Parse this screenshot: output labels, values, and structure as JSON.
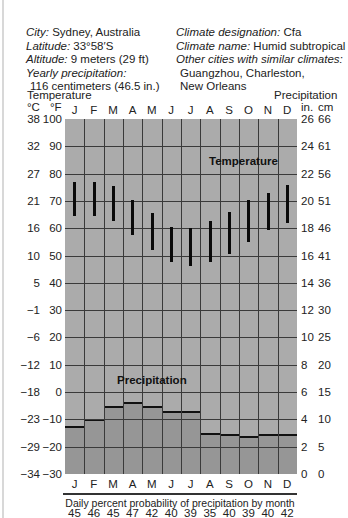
{
  "info": {
    "city_label": "City:",
    "city": "Sydney, Australia",
    "latitude_label": "Latitude:",
    "latitude": "33°58′S",
    "altitude_label": "Altitude:",
    "altitude": "9 meters (29 ft)",
    "yearly_precip_label": "Yearly precipitation:",
    "yearly_precip": "116 centimeters (46.5 in.)",
    "climate_designation_label": "Climate designation:",
    "climate_designation": "Cfa",
    "climate_name_label": "Climate name:",
    "climate_name": "Humid subtropical",
    "similar_label": "Other cities with similar climates:",
    "similar_line1": "Guangzhou, Charleston,",
    "similar_line2": "New Orleans"
  },
  "axes": {
    "left_title": "Temperature",
    "right_title": "Precipitation",
    "left_unit_c": "°C",
    "left_unit_f": "°F",
    "right_unit_in": "in.",
    "right_unit_cm": "cm",
    "celsius_ticks": [
      "38",
      "32",
      "27",
      "21",
      "16",
      "10",
      "5",
      "−1",
      "−6",
      "−12",
      "−18",
      "−23",
      "−29",
      "−34"
    ],
    "fahrenheit_ticks": [
      "100",
      "90",
      "80",
      "70",
      "60",
      "50",
      "40",
      "30",
      "20",
      "10",
      "0",
      "−10",
      "−20",
      "−30"
    ],
    "inch_ticks": [
      "26",
      "24",
      "22",
      "20",
      "18",
      "16",
      "14",
      "12",
      "10",
      "8",
      "6",
      "4",
      "2",
      "0"
    ],
    "cm_ticks": [
      "66",
      "61",
      "56",
      "51",
      "46",
      "41",
      "36",
      "30",
      "25",
      "20",
      "15",
      "10",
      "5",
      "0"
    ],
    "months": [
      "J",
      "F",
      "M",
      "A",
      "M",
      "J",
      "J",
      "A",
      "S",
      "O",
      "N",
      "D"
    ]
  },
  "labels": {
    "temperature": "Temperature",
    "precipitation": "Precipitation",
    "probability_title": "Daily percent probability of precipitation by month"
  },
  "colors": {
    "plot_bg": "#ababab",
    "precip_bar": "#969696",
    "temp_bar": "#0a0a0a",
    "grid": "#3a3a3a"
  },
  "chart_data": {
    "type": "climograph",
    "categories": [
      "J",
      "F",
      "M",
      "A",
      "M",
      "J",
      "J",
      "A",
      "S",
      "O",
      "N",
      "D"
    ],
    "series": [
      {
        "name": "Temperature range (°F)",
        "chart_type": "range-bar",
        "high": [
          77,
          77,
          75.5,
          70.5,
          65.5,
          60.5,
          60,
          62.5,
          66,
          70.5,
          73,
          76
        ],
        "low": [
          64.5,
          64.5,
          62.5,
          57.5,
          52,
          47.5,
          46,
          47.5,
          50.5,
          55,
          59.5,
          62
        ]
      },
      {
        "name": "Precipitation (in.)",
        "chart_type": "bar",
        "values": [
          3.5,
          4.0,
          5.0,
          5.3,
          5.0,
          4.6,
          4.6,
          3.0,
          2.9,
          2.8,
          2.9,
          2.9
        ]
      }
    ],
    "probability_of_precipitation_pct": [
      45,
      46,
      45,
      47,
      42,
      40,
      39,
      35,
      40,
      39,
      40,
      42
    ],
    "ylabel_left": "Temperature (°C / °F)",
    "ylabel_right": "Precipitation (in. / cm)",
    "ylim_f": [
      -30,
      100
    ],
    "ylim_in": [
      0,
      26
    ],
    "grid": true
  }
}
